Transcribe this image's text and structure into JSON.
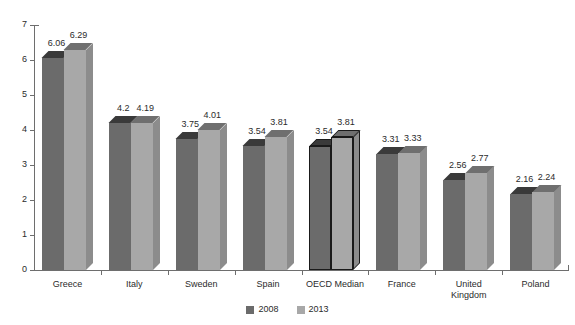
{
  "chart_data": {
    "type": "bar",
    "title": "",
    "subtitle": "",
    "xlabel": "",
    "ylabel": "",
    "ylim": [
      0,
      7
    ],
    "ytick_labels": [
      "0",
      "1",
      "2",
      "3",
      "4",
      "5",
      "6",
      "7"
    ],
    "ytick_values": [
      0,
      1,
      2,
      3,
      4,
      5,
      6,
      7
    ],
    "grid": false,
    "legend_position": "bottom-center",
    "style": "3d-bar",
    "categories": [
      "Greece",
      "Italy",
      "Sweden",
      "Spain",
      "OECD Median",
      "France",
      "United\nKingdom",
      "Poland"
    ],
    "highlighted_category": "OECD Median",
    "series": [
      {
        "name": "2008",
        "color": "#6b6b6b",
        "values": [
          6.06,
          4.2,
          3.75,
          3.54,
          3.54,
          3.31,
          2.56,
          2.16
        ],
        "value_labels": [
          "6.06",
          "4.2",
          "3.75",
          "3.54",
          "3.54",
          "3.31",
          "2.56",
          "2.16"
        ]
      },
      {
        "name": "2013",
        "color": "#a8a8a8",
        "values": [
          6.29,
          4.19,
          4.01,
          3.81,
          3.81,
          3.33,
          2.77,
          2.24
        ],
        "value_labels": [
          "6.29",
          "4.19",
          "4.01",
          "3.81",
          "3.81",
          "3.33",
          "2.77",
          "2.24"
        ]
      }
    ]
  },
  "legend": {
    "items": [
      {
        "label": "2008",
        "color": "#6b6b6b"
      },
      {
        "label": "2013",
        "color": "#a8a8a8"
      }
    ]
  },
  "colors": {
    "series_2008_front": "#6b6b6b",
    "series_2008_top": "#3a3a3a",
    "series_2008_side": "#4f4f4f",
    "series_2013_front": "#a8a8a8",
    "series_2013_top": "#6f6f6f",
    "series_2013_side": "#8c8c8c",
    "axis": "#6e6e6e",
    "text": "#2b2b2b",
    "highlight_outline": "#1a1a1a",
    "background": "#ffffff"
  }
}
